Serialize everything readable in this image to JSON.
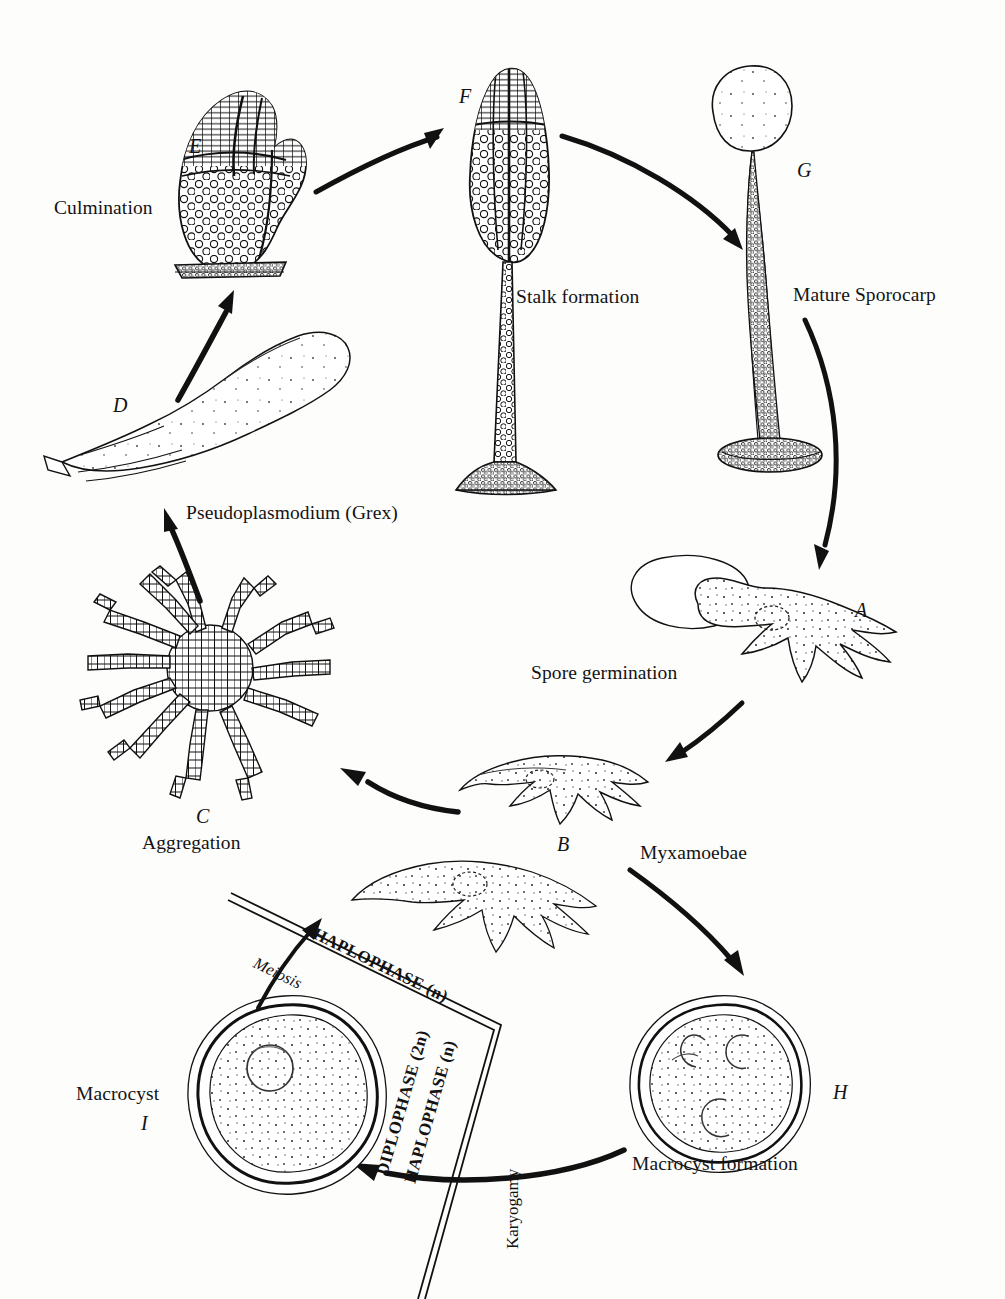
{
  "diagram": {
    "ink_color": "#111111",
    "background_color": "#fdfdfc"
  },
  "stages": [
    {
      "id": "A",
      "letter": "A",
      "name": "Spore germination",
      "letter_x": 855,
      "letter_y": 600,
      "name_x": 531,
      "name_y": 663
    },
    {
      "id": "B",
      "letter": "B",
      "name": "Myxamoebae",
      "letter_x": 557,
      "letter_y": 834,
      "name_x": 640,
      "name_y": 843
    },
    {
      "id": "C",
      "letter": "C",
      "name": "Aggregation",
      "letter_x": 196,
      "letter_y": 806,
      "name_x": 142,
      "name_y": 833
    },
    {
      "id": "D",
      "letter": "D",
      "name": "Pseudoplasmodium (Grex)",
      "letter_x": 113,
      "letter_y": 395,
      "name_x": 186,
      "name_y": 503
    },
    {
      "id": "E",
      "letter": "E",
      "name": "Culmination",
      "letter_x": 189,
      "letter_y": 136,
      "name_x": 54,
      "name_y": 198
    },
    {
      "id": "F",
      "letter": "F",
      "name": "Stalk formation",
      "letter_x": 459,
      "letter_y": 86,
      "name_x": 516,
      "name_y": 287
    },
    {
      "id": "G",
      "letter": "G",
      "name": "Mature Sporocarp",
      "letter_x": 797,
      "letter_y": 160,
      "name_x": 793,
      "name_y": 285
    },
    {
      "id": "H",
      "letter": "H",
      "name": "Macrocyst formation",
      "letter_x": 833,
      "letter_y": 1082,
      "name_x": 632,
      "name_y": 1154
    },
    {
      "id": "I",
      "letter": "I",
      "name": "Macrocyst",
      "letter_x": 141,
      "letter_y": 1113,
      "name_x": 76,
      "name_y": 1084
    }
  ],
  "phase_labels": {
    "haplophase_top": "HAPLOPHASE (n)",
    "diplophase": "DIPLOPHASE (2n)",
    "haplophase_lower": "HAPLOPHASE (n)"
  },
  "process_labels": {
    "meiosis": "Meiosis",
    "karyogamy": "Karyogamy"
  }
}
